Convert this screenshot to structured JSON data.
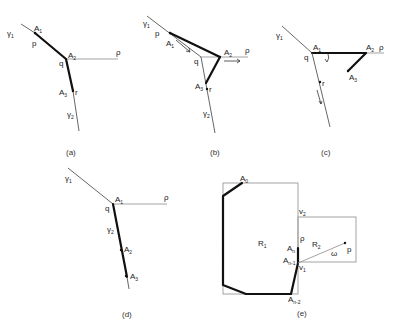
{
  "panels": {
    "a": {
      "caption": "(a)",
      "labels": {
        "gamma1": "γ",
        "gamma1_sub": "1",
        "A1": "A",
        "A1_sub": "1",
        "p": "p",
        "A2": "A",
        "A2_sub": "2",
        "q": "q",
        "rho": "ρ",
        "A3": "A",
        "A3_sub": "3",
        "r": "r",
        "gamma2": "γ",
        "gamma2_sub": "2"
      }
    },
    "b": {
      "caption": "(b)",
      "labels": {
        "gamma1": "γ",
        "gamma1_sub": "1",
        "p": "p",
        "A1": "A",
        "A1_sub": "1",
        "q": "q",
        "A2": "A",
        "A2_sub": "2",
        "rho": "ρ",
        "A3": "A",
        "A3_sub": "3",
        "r": "r",
        "gamma2": "γ",
        "gamma2_sub": "2"
      }
    },
    "c": {
      "caption": "(c)",
      "labels": {
        "gamma1": "γ",
        "gamma1_sub": "1",
        "A1": "A",
        "A1_sub": "1",
        "q": "q",
        "A2": "A",
        "A2_sub": "2",
        "rho": "ρ",
        "A3": "A",
        "A3_sub": "3",
        "r": "r"
      }
    },
    "d": {
      "caption": "(d)",
      "labels": {
        "gamma1": "γ",
        "gamma1_sub": "1",
        "A1": "A",
        "A1_sub": "1",
        "q": "q",
        "rho": "ρ",
        "gamma2": "γ",
        "gamma2_sub": "2",
        "A2": "A",
        "A2_sub": "2",
        "A3": "A",
        "A3_sub": "3"
      }
    },
    "e": {
      "caption": "(e)",
      "labels": {
        "A0": "A",
        "A0_sub": "0",
        "v2": "v",
        "v2_sub": "2",
        "R1": "R",
        "R1_sub": "1",
        "rho": "ρ",
        "An": "A",
        "An_sub": "n",
        "R2": "R",
        "R2_sub": "2",
        "An1": "A",
        "An1_sub": "n-1",
        "v1": "v",
        "v1_sub": "1",
        "omega": "ω",
        "p": "p",
        "An2": "A",
        "An2_sub": "n-2"
      }
    }
  }
}
